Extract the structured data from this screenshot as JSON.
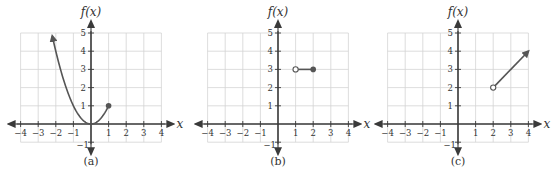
{
  "chart_data": [
    {
      "type": "line",
      "caption": "(a)",
      "ylabel": "f(x)",
      "xlabel": "x",
      "xlim": [
        -4,
        4
      ],
      "ylim": [
        -1,
        5
      ],
      "x_ticks": [
        -4,
        -3,
        -2,
        -1,
        1,
        2,
        3,
        4
      ],
      "y_ticks": [
        -1,
        1,
        2,
        3,
        4,
        5
      ],
      "grid": true,
      "series": [
        {
          "name": "f(x) = x^2, x <= 1",
          "kind": "parabola",
          "x": [
            -2.2,
            -2,
            -1.5,
            -1,
            -0.5,
            0,
            0.5,
            1
          ],
          "y": [
            4.84,
            4,
            2.25,
            1,
            0.25,
            0,
            0.25,
            1
          ],
          "start": {
            "x": -2.2,
            "y": 4.84,
            "marker": "arrow"
          },
          "end": {
            "x": 1,
            "y": 1,
            "marker": "closed-dot"
          }
        }
      ]
    },
    {
      "type": "line",
      "caption": "(b)",
      "ylabel": "f(x)",
      "xlabel": "x",
      "xlim": [
        -4,
        4
      ],
      "ylim": [
        -1,
        5
      ],
      "x_ticks": [
        -4,
        -3,
        -2,
        -1,
        1,
        2,
        3,
        4
      ],
      "y_ticks": [
        -1,
        1,
        2,
        3,
        4,
        5
      ],
      "grid": true,
      "series": [
        {
          "name": "f(x) = 3, 1 < x <= 2",
          "kind": "segment",
          "x": [
            1,
            2
          ],
          "y": [
            3,
            3
          ],
          "start": {
            "x": 1,
            "y": 3,
            "marker": "open-dot"
          },
          "end": {
            "x": 2,
            "y": 3,
            "marker": "closed-dot"
          }
        }
      ]
    },
    {
      "type": "line",
      "caption": "(c)",
      "ylabel": "f(x)",
      "xlabel": "x",
      "xlim": [
        -4,
        4
      ],
      "ylim": [
        -1,
        5
      ],
      "x_ticks": [
        -4,
        -3,
        -2,
        -1,
        1,
        2,
        3,
        4
      ],
      "y_ticks": [
        -1,
        1,
        2,
        3,
        4,
        5
      ],
      "grid": true,
      "series": [
        {
          "name": "f(x) = x, x > 2",
          "kind": "ray",
          "x": [
            2,
            4
          ],
          "y": [
            2,
            4
          ],
          "start": {
            "x": 2,
            "y": 2,
            "marker": "open-dot"
          },
          "end": {
            "x": 4,
            "y": 4,
            "marker": "arrow"
          }
        }
      ]
    }
  ],
  "panels": [
    {
      "caption": "(a)",
      "ylabel": "f(x)",
      "xlabel": "x"
    },
    {
      "caption": "(b)",
      "ylabel": "f(x)",
      "xlabel": "x"
    },
    {
      "caption": "(c)",
      "ylabel": "f(x)",
      "xlabel": "x"
    }
  ],
  "colors": {
    "curve": "#555555",
    "axis": "#3a3a3a",
    "grid": "#d4d4d4",
    "text": "#333333"
  }
}
